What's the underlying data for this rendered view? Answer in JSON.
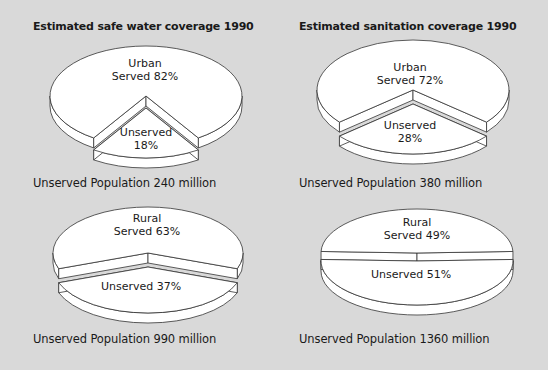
{
  "colors": {
    "background": "#d9d9d9",
    "slice_fill": "#ffffff",
    "outline": "#333333",
    "text": "#1a1a1a"
  },
  "chart_data": [
    {
      "type": "pie",
      "title": "Estimated safe water coverage 1990",
      "group": "Urban",
      "slices": [
        {
          "label": "Served",
          "value": 82
        },
        {
          "label": "Unserved",
          "value": 18,
          "exploded": true
        }
      ],
      "caption": "Unserved Population 240 million"
    },
    {
      "type": "pie",
      "title": "Estimated sanitation coverage 1990",
      "group": "Urban",
      "slices": [
        {
          "label": "Served",
          "value": 72
        },
        {
          "label": "Unserved",
          "value": 28,
          "exploded": true
        }
      ],
      "caption": "Unserved Population 380 million"
    },
    {
      "type": "pie",
      "title": "",
      "group": "Rural",
      "slices": [
        {
          "label": "Served",
          "value": 63
        },
        {
          "label": "Unserved",
          "value": 37,
          "exploded": true
        }
      ],
      "caption": "Unserved Population 990 million"
    },
    {
      "type": "pie",
      "title": "",
      "group": "Rural",
      "slices": [
        {
          "label": "Served",
          "value": 49
        },
        {
          "label": "Unserved",
          "value": 51,
          "exploded": true
        }
      ],
      "caption": "Unserved Population 1360 million"
    }
  ],
  "panels": [
    {
      "title": "Estimated safe water coverage 1990",
      "served_line1": "Urban",
      "served_line2": "Served 82%",
      "unserved_line1": "Unserved",
      "unserved_line2": "18%",
      "caption": "Unserved Population 240 million"
    },
    {
      "title": "Estimated sanitation coverage 1990",
      "served_line1": "Urban",
      "served_line2": "Served 72%",
      "unserved_line1": "Unserved",
      "unserved_line2": "28%",
      "caption": "Unserved Population 380 million"
    },
    {
      "title": "",
      "served_line1": "Rural",
      "served_line2": "Served 63%",
      "unserved_line1": "Unserved 37%",
      "unserved_line2": "",
      "caption": "Unserved Population 990 million"
    },
    {
      "title": "",
      "served_line1": "Rural",
      "served_line2": "Served 49%",
      "unserved_line1": "Unserved 51%",
      "unserved_line2": "",
      "caption": "Unserved Population 1360 million"
    }
  ]
}
